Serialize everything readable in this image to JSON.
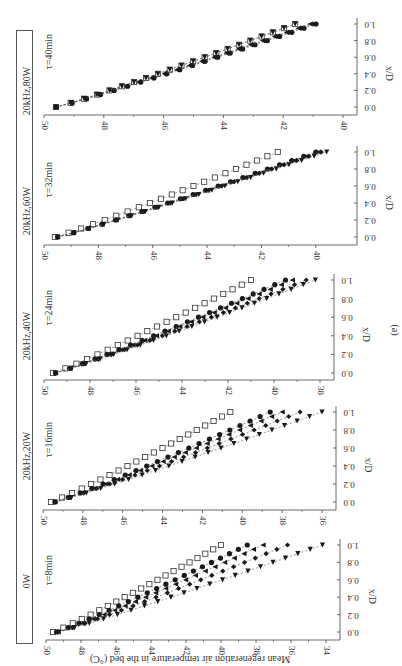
{
  "figure_label": "(a)",
  "legend": [
    {
      "label": "0W",
      "marker": "open-square"
    },
    {
      "label": "20kHz,20W",
      "marker": "filled-circle"
    },
    {
      "label": "20kHz,40W",
      "marker": "filled-triangle-left"
    },
    {
      "label": "20kHz,60W",
      "marker": "filled-diamond"
    },
    {
      "label": "20kHz,80W",
      "marker": "filled-triangle-down"
    }
  ],
  "chart_data": [
    {
      "type": "scatter",
      "title": "τ=8min",
      "xlabel": "x/D",
      "ylabel": "Mean regeneration air temperature in the bed (°C)",
      "xlim": [
        0,
        1.0
      ],
      "ylim": [
        34,
        50
      ],
      "xticks": [
        "0.0",
        "0.2",
        "0.4",
        "0.6",
        "0.8",
        "1.0"
      ],
      "yticks": [
        "50",
        "48",
        "46",
        "44",
        "42",
        "40",
        "38",
        "36",
        "34"
      ],
      "series": [
        {
          "name": "0W",
          "start": 49.6,
          "end": 40.0
        },
        {
          "name": "20kHz,20W",
          "start": 49.4,
          "end": 38.5
        },
        {
          "name": "20kHz,40W",
          "start": 49.3,
          "end": 37.6
        },
        {
          "name": "20kHz,60W",
          "start": 49.3,
          "end": 36.2
        },
        {
          "name": "20kHz,80W",
          "start": 49.3,
          "end": 34.2
        }
      ]
    },
    {
      "type": "scatter",
      "title": "τ=16min",
      "xlabel": "x/D",
      "ylabel": "Mean regeneration air temperature in the bed (°C)",
      "xlim": [
        0,
        1.0
      ],
      "ylim": [
        36,
        50
      ],
      "xticks": [
        "0.0",
        "0.2",
        "0.4",
        "0.6",
        "0.8",
        "1.0"
      ],
      "yticks": [
        "50",
        "48",
        "46",
        "44",
        "42",
        "40",
        "38",
        "36"
      ],
      "series": [
        {
          "name": "0W",
          "start": 49.6,
          "end": 40.6
        },
        {
          "name": "20kHz,20W",
          "start": 49.4,
          "end": 38.6
        },
        {
          "name": "20kHz,40W",
          "start": 49.4,
          "end": 38.0
        },
        {
          "name": "20kHz,60W",
          "start": 49.4,
          "end": 37.1
        },
        {
          "name": "20kHz,80W",
          "start": 49.4,
          "end": 36.0
        }
      ]
    },
    {
      "type": "scatter",
      "title": "τ=24min",
      "xlabel": "x/D",
      "ylabel": "Mean regeneration air temperature in the bed (°C)",
      "xlim": [
        0,
        1.0
      ],
      "ylim": [
        38,
        50
      ],
      "xticks": [
        "0.0",
        "0.2",
        "0.4",
        "0.6",
        "0.8",
        "1.0"
      ],
      "yticks": [
        "50",
        "48",
        "46",
        "44",
        "42",
        "40",
        "38"
      ],
      "series": [
        {
          "name": "0W",
          "start": 49.6,
          "end": 41.0
        },
        {
          "name": "20kHz,20W",
          "start": 49.5,
          "end": 39.5
        },
        {
          "name": "20kHz,40W",
          "start": 49.5,
          "end": 39.2
        },
        {
          "name": "20kHz,60W",
          "start": 49.5,
          "end": 38.6
        },
        {
          "name": "20kHz,80W",
          "start": 49.5,
          "end": 38.2
        }
      ]
    },
    {
      "type": "scatter",
      "title": "τ=32min",
      "xlabel": "x/D",
      "ylabel": "Mean regeneration air temperature in the bed (°C)",
      "xlim": [
        0,
        1.0
      ],
      "ylim": [
        39,
        50
      ],
      "xticks": [
        "0.0",
        "0.2",
        "0.4",
        "0.6",
        "0.8",
        "1.0"
      ],
      "yticks": [
        "50",
        "48",
        "46",
        "44",
        "42",
        "40"
      ],
      "series": [
        {
          "name": "0W",
          "start": 49.6,
          "end": 41.4
        },
        {
          "name": "20kHz,20W",
          "start": 49.5,
          "end": 40.0
        },
        {
          "name": "20kHz,40W",
          "start": 49.5,
          "end": 39.9
        },
        {
          "name": "20kHz,60W",
          "start": 49.5,
          "end": 39.8
        },
        {
          "name": "20kHz,80W",
          "start": 49.5,
          "end": 39.6
        }
      ]
    },
    {
      "type": "scatter",
      "title": "τ=40min",
      "xlabel": "x/D",
      "ylabel": "Mean regeneration air temperature in the bed (°C)",
      "xlim": [
        0,
        1.0
      ],
      "ylim": [
        40,
        50
      ],
      "xticks": [
        "0.0",
        "0.2",
        "0.4",
        "0.6",
        "0.8",
        "1.0"
      ],
      "yticks": [
        "50",
        "48",
        "46",
        "44",
        "42",
        "40"
      ],
      "series": [
        {
          "name": "0W",
          "start": 49.6,
          "end": 41.6
        },
        {
          "name": "20kHz,20W",
          "start": 49.6,
          "end": 40.9
        },
        {
          "name": "20kHz,40W",
          "start": 49.6,
          "end": 41.1
        },
        {
          "name": "20kHz,60W",
          "start": 49.6,
          "end": 41.0
        },
        {
          "name": "20kHz,80W",
          "start": 49.6,
          "end": 41.6
        }
      ]
    }
  ]
}
